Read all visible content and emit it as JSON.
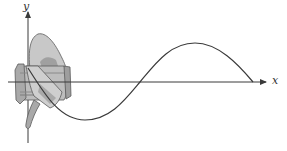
{
  "figure": {
    "axes": {
      "x_label": "x",
      "y_label": "y"
    },
    "colors": {
      "line": "#3a3a3a",
      "propeller_light": "#c8c8c8",
      "propeller_mid": "#a9a9a9",
      "propeller_dark": "#7d7d7d",
      "background": "#ffffff"
    },
    "curve": {
      "shape": "sinusoid",
      "start": [
        28,
        68
      ],
      "trough": [
        85,
        120
      ],
      "x_crossing": [
        140,
        82
      ],
      "peak": [
        195,
        43
      ],
      "end": [
        253,
        82
      ]
    }
  }
}
